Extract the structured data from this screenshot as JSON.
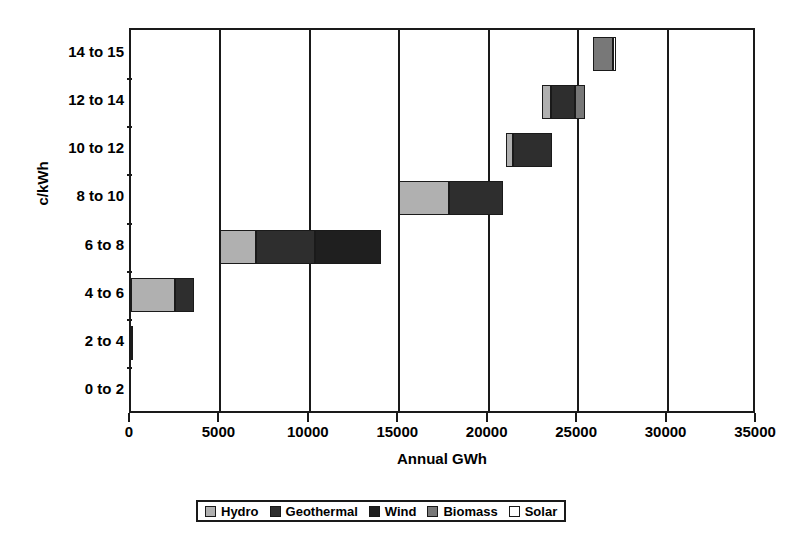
{
  "chart_data": {
    "type": "bar",
    "orientation": "horizontal",
    "stacked": true,
    "title": "",
    "xlabel": "Annual GWh",
    "ylabel": "c/kWh",
    "xlim": [
      0,
      35000
    ],
    "xticks": [
      0,
      5000,
      10000,
      15000,
      20000,
      25000,
      30000,
      35000
    ],
    "xtick_labels": [
      "0",
      "5000",
      "10000",
      "15000",
      "20000",
      "25000",
      "30000",
      "35000"
    ],
    "grid": "vertical",
    "legend_position": "bottom",
    "categories": [
      "0 to 2",
      "2 to 4",
      "4 to 6",
      "6 to 8",
      "8 to 10",
      "10 to 12",
      "12 to 14",
      "14 to 15"
    ],
    "series": [
      {
        "name": "Hydro",
        "color": "#b0b0b0",
        "values": [
          0,
          100,
          2450,
          2000,
          2800,
          400,
          500,
          0
        ]
      },
      {
        "name": "Geothermal",
        "color": "#2e2e2e",
        "values": [
          0,
          0,
          1050,
          3300,
          3000,
          2200,
          1300,
          0
        ]
      },
      {
        "name": "Wind",
        "color": "#1f1f1f",
        "values": [
          0,
          0,
          0,
          3700,
          0,
          0,
          0,
          0
        ]
      },
      {
        "name": "Biomass",
        "color": "#787878",
        "values": [
          0,
          0,
          0,
          0,
          0,
          0,
          600,
          1100
        ]
      },
      {
        "name": "Solar",
        "color": "#ffffff",
        "values": [
          0,
          0,
          0,
          0,
          0,
          0,
          0,
          150
        ]
      }
    ],
    "bar_starts": [
      0,
      0,
      0,
      5000,
      15000,
      20950,
      23000,
      25850
    ]
  },
  "axis": {
    "y_title": "c/kWh",
    "x_title": "Annual GWh"
  },
  "legend": {
    "items": [
      {
        "label": "Hydro",
        "swatch": "legend-swatch-hydro",
        "color": "#b0b0b0"
      },
      {
        "label": "Geothermal",
        "swatch": "legend-swatch-geothermal",
        "color": "#2e2e2e"
      },
      {
        "label": "Wind",
        "swatch": "legend-swatch-wind",
        "color": "#1f1f1f"
      },
      {
        "label": "Biomass",
        "swatch": "legend-swatch-biomass",
        "color": "#787878"
      },
      {
        "label": "Solar",
        "swatch": "legend-swatch-solar",
        "color": "#ffffff"
      }
    ]
  }
}
